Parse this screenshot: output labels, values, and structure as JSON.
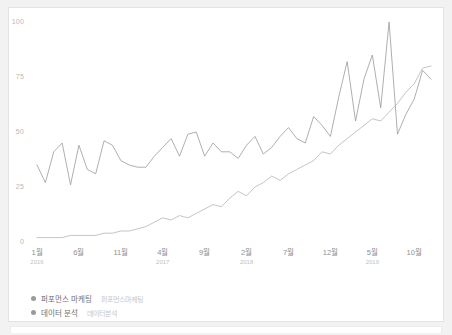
{
  "card": {
    "name": "chart-card"
  },
  "chart_data": {
    "type": "line",
    "title": "",
    "xlabel": "",
    "ylabel": "",
    "ylim": [
      0,
      100
    ],
    "grid": false,
    "legend_position": "bottom-left",
    "yticks": [
      "0",
      "25",
      "50",
      "75",
      "100"
    ],
    "ytick_values": [
      0,
      25,
      50,
      75,
      100
    ],
    "xticks": [
      {
        "month": "1월",
        "year": "2016"
      },
      {
        "month": "6월",
        "year": ""
      },
      {
        "month": "11월",
        "year": ""
      },
      {
        "month": "4월",
        "year": "2017"
      },
      {
        "month": "9월",
        "year": ""
      },
      {
        "month": "2월",
        "year": "2018"
      },
      {
        "month": "7월",
        "year": ""
      },
      {
        "month": "12월",
        "year": ""
      },
      {
        "month": "5월",
        "year": "2019"
      },
      {
        "month": "10월",
        "year": ""
      }
    ],
    "xtick_indices": [
      0,
      5,
      10,
      15,
      20,
      25,
      30,
      35,
      40,
      45
    ],
    "x": [
      "2016-01",
      "2016-02",
      "2016-03",
      "2016-04",
      "2016-05",
      "2016-06",
      "2016-07",
      "2016-08",
      "2016-09",
      "2016-10",
      "2016-11",
      "2016-12",
      "2017-01",
      "2017-02",
      "2017-03",
      "2017-04",
      "2017-05",
      "2017-06",
      "2017-07",
      "2017-08",
      "2017-09",
      "2017-10",
      "2017-11",
      "2017-12",
      "2018-01",
      "2018-02",
      "2018-03",
      "2018-04",
      "2018-05",
      "2018-06",
      "2018-07",
      "2018-08",
      "2018-09",
      "2018-10",
      "2018-11",
      "2018-12",
      "2019-01",
      "2019-02",
      "2019-03",
      "2019-04",
      "2019-05",
      "2019-06",
      "2019-07",
      "2019-08",
      "2019-09",
      "2019-10",
      "2019-11",
      "2019-12"
    ],
    "series": [
      {
        "name": "퍼포먼스 마케팅",
        "color": "#9b9b9b",
        "values": [
          35,
          27,
          41,
          45,
          26,
          44,
          33,
          31,
          46,
          44,
          37,
          35,
          34,
          34,
          39,
          43,
          47,
          39,
          49,
          50,
          39,
          45,
          41,
          41,
          38,
          44,
          48,
          40,
          43,
          48,
          52,
          47,
          45,
          57,
          53,
          48,
          66,
          82,
          55,
          74,
          85,
          61,
          100,
          49,
          58,
          65,
          78,
          74
        ]
      },
      {
        "name": "데이터 분석",
        "color": "#b5b5b5",
        "values": [
          2,
          2,
          2,
          2,
          3,
          3,
          3,
          3,
          4,
          4,
          5,
          5,
          6,
          7,
          9,
          11,
          10,
          12,
          11,
          13,
          15,
          17,
          16,
          20,
          23,
          21,
          25,
          27,
          30,
          28,
          31,
          33,
          35,
          37,
          41,
          40,
          44,
          47,
          50,
          53,
          56,
          55,
          59,
          63,
          68,
          72,
          79,
          80
        ]
      }
    ]
  },
  "legend": {
    "items": [
      {
        "label": "퍼포먼스 마케팅",
        "sub": "퍼포먼스마케팅",
        "color": "#9a9a9a"
      },
      {
        "label": "데이터 분석",
        "sub": "데이터분석",
        "color": "#9a9a9a"
      }
    ]
  }
}
